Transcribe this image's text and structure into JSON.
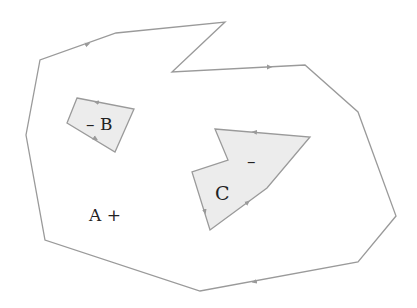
{
  "diagram": {
    "colors": {
      "stroke": "#9a9a9a",
      "fill_hole": "#ececec",
      "text": "#222222",
      "background": "#ffffff"
    },
    "regions": {
      "A": {
        "name": "A",
        "sign": "+",
        "label": "A +",
        "points": "116,33 225,22 172,72 305,65 358,112 396,216 358,262 200,291 45,240 26,135 40,60"
      },
      "B": {
        "name": "B",
        "sign": "–",
        "label": "– B",
        "points": "77,98 134,109 115,152 67,123"
      },
      "C": {
        "name": "C",
        "sign": "–",
        "label": "C",
        "points": "215,129 310,137 267,188 210,230 192,172 228,160"
      }
    }
  }
}
